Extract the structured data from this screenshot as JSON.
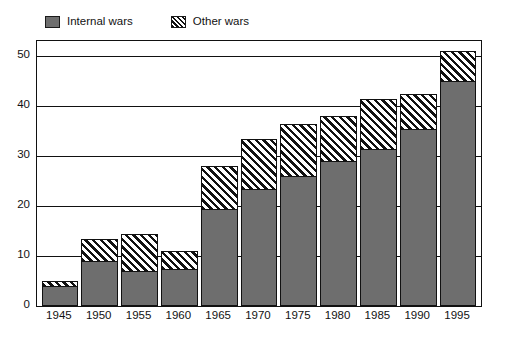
{
  "legend": {
    "position": "top-left",
    "items": [
      {
        "label": "Internal wars",
        "swatch": "solid-gray-swatch-icon",
        "color": "#6e6e6e",
        "pattern": "solid"
      },
      {
        "label": "Other wars",
        "swatch": "diagonal-hatch-swatch-icon",
        "color": "#111111",
        "pattern": "diagonal-hatch"
      }
    ]
  },
  "axes": {
    "y_ticks": [
      "0",
      "10",
      "20",
      "30",
      "40",
      "50"
    ],
    "x_ticks": [
      "1945",
      "1950",
      "1955",
      "1960",
      "1965",
      "1970",
      "1975",
      "1980",
      "1985",
      "1990",
      "1995"
    ]
  },
  "chart_data": {
    "type": "bar",
    "stacked": true,
    "title": "",
    "subtitle": "",
    "xlabel": "",
    "ylabel": "",
    "categories": [
      "1945",
      "1950",
      "1955",
      "1960",
      "1965",
      "1970",
      "1975",
      "1980",
      "1985",
      "1990",
      "1995"
    ],
    "series": [
      {
        "name": "Internal wars",
        "color": "#6e6e6e",
        "pattern": "solid",
        "values": [
          4,
          9,
          7,
          7.5,
          19.5,
          23.5,
          26,
          29,
          31.5,
          35.5,
          45
        ]
      },
      {
        "name": "Other wars",
        "color": "#111111",
        "pattern": "diagonal-hatch",
        "values": [
          1,
          4.5,
          7.5,
          3.5,
          8.5,
          10,
          10.5,
          9,
          10,
          7,
          6
        ]
      }
    ],
    "totals": [
      5,
      13.5,
      14.5,
      11,
      28,
      33.5,
      36.5,
      38,
      41.5,
      42.5,
      51
    ],
    "ylim": [
      0,
      53
    ],
    "yticks": [
      0,
      10,
      20,
      30,
      40,
      50
    ],
    "grid": true,
    "grid_axis": "y",
    "legend_position": "top-left"
  }
}
